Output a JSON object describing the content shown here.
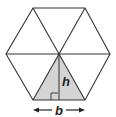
{
  "diagram": {
    "shape": "regular-hexagon",
    "subdivision": "six equilateral triangles from center",
    "shaded_triangle": "bottom",
    "labels": {
      "height": "h",
      "base": "b"
    },
    "colors": {
      "stroke": "#333333",
      "shade": "#d4d4d4",
      "background": "#ffffff"
    }
  }
}
